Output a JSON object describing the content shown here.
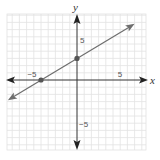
{
  "chart_data": {
    "type": "line",
    "title": "",
    "xlabel": "x",
    "ylabel": "y",
    "xlim": [
      -10,
      9.5
    ],
    "ylim": [
      -9.5,
      9
    ],
    "grid": true,
    "tick_labels": {
      "x": [
        {
          "value": -5,
          "label": "−5"
        },
        {
          "value": 5,
          "label": "5"
        }
      ],
      "y": [
        {
          "value": 5,
          "label": "5"
        },
        {
          "value": -5,
          "label": "−5"
        }
      ]
    },
    "series": [
      {
        "name": "line",
        "equation": "y = (3/5)x + 3",
        "slope": 0.6,
        "intercept": 3,
        "arrows_both_ends": true,
        "x": [
          -9.6,
          8.0
        ],
        "y": [
          -2.8,
          7.8
        ]
      }
    ],
    "points": [
      {
        "x": -5,
        "y": 0,
        "label": "x-intercept"
      },
      {
        "x": 0,
        "y": 3,
        "label": "y-intercept"
      }
    ]
  },
  "colors": {
    "grid": "#e2e2e2",
    "axis": "#333333",
    "line": "#6e6e6e",
    "point": "#555555"
  },
  "labels": {
    "x_axis": "x",
    "y_axis": "y",
    "x_neg5": "−5",
    "x_pos5": "5",
    "y_pos5": "5",
    "y_neg5": "−5"
  }
}
